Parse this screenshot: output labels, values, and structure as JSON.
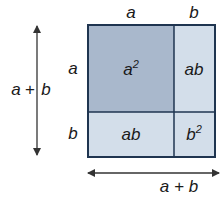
{
  "diagram": {
    "top_labels": {
      "a": "a",
      "b": "b"
    },
    "side_labels": {
      "a": "a",
      "b": "b"
    },
    "vertical_dimension": {
      "left": "a",
      "op": "+",
      "right": "b"
    },
    "horizontal_dimension": {
      "text": "a + b"
    },
    "regions": {
      "a_squared": {
        "base": "a",
        "exp": "2",
        "color": "#a9b8cc"
      },
      "ab_top_right": {
        "text": "ab",
        "color": "#d3deea"
      },
      "ab_bottom_left": {
        "text": "ab",
        "color": "#d3deea"
      },
      "b_squared": {
        "base": "b",
        "exp": "2",
        "color": "#d3deea"
      }
    },
    "border_color": "#1f3550",
    "arrow_color": "#333333"
  }
}
